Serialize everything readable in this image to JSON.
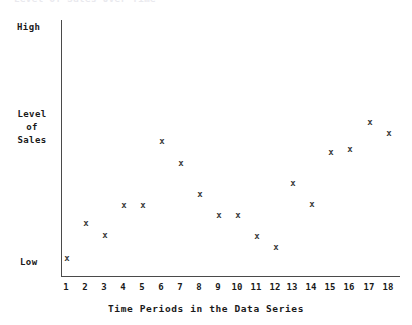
{
  "chart_data": {
    "type": "scatter",
    "title": "Level of Sales Over Time",
    "xlabel": "Time Periods in the Data Series",
    "ylabel": "Level of Sales",
    "ylim": [
      0,
      100
    ],
    "xlim": [
      0.5,
      18.5
    ],
    "grid": false,
    "legend": null,
    "marker": "x",
    "marker_color": "#3a3a3a",
    "y_tick_labels": [
      "Low",
      "High"
    ],
    "y_tick_values": [
      8,
      97
    ],
    "categories": [
      1,
      2,
      3,
      4,
      5,
      6,
      7,
      8,
      9,
      10,
      11,
      12,
      13,
      14,
      15,
      16,
      17,
      18
    ],
    "x_tick_labels": [
      "1",
      "2",
      "3",
      "4",
      "5",
      "6",
      "7",
      "8",
      "9",
      "10",
      "11",
      "12",
      "13",
      "14",
      "15",
      "16",
      "17",
      "18"
    ],
    "values": [
      9,
      23,
      18,
      30,
      30,
      55,
      47,
      35,
      26,
      26,
      17,
      13,
      40,
      30,
      50,
      59,
      70,
      64
    ],
    "points": [
      {
        "x": 1,
        "y": 9,
        "px": 66,
        "py": 258
      },
      {
        "x": 2,
        "y": 23,
        "px": 85,
        "py": 223
      },
      {
        "x": 3,
        "y": 18,
        "px": 104,
        "py": 235
      },
      {
        "x": 4,
        "y": 30,
        "px": 123,
        "py": 205
      },
      {
        "x": 5,
        "y": 30,
        "px": 142,
        "py": 205
      },
      {
        "x": 6,
        "y": 55,
        "px": 161,
        "py": 141
      },
      {
        "x": 7,
        "y": 47,
        "px": 180,
        "py": 163
      },
      {
        "x": 8,
        "y": 35,
        "px": 199,
        "py": 194
      },
      {
        "x": 9,
        "y": 26,
        "px": 218,
        "py": 215
      },
      {
        "x": 10,
        "y": 26,
        "px": 237,
        "py": 215
      },
      {
        "x": 11,
        "y": 17,
        "px": 256,
        "py": 236
      },
      {
        "x": 12,
        "y": 13,
        "px": 275,
        "py": 247
      },
      {
        "x": 13,
        "y": 40,
        "px": 292,
        "py": 183
      },
      {
        "x": 14,
        "y": 30,
        "px": 311,
        "py": 204
      },
      {
        "x": 15,
        "y": 50,
        "px": 330,
        "py": 152
      },
      {
        "x": 16,
        "y": 59,
        "px": 349,
        "py": 149
      },
      {
        "x": 17,
        "y": 70,
        "px": 369,
        "py": 122
      },
      {
        "x": 18,
        "y": 64,
        "px": 388,
        "py": 133
      }
    ]
  },
  "axes": {
    "y_high_label": "High",
    "y_low_label": "Low",
    "y_title_lines": [
      "Level",
      "of",
      "Sales"
    ],
    "x_title": "Time Periods in the Data Series"
  },
  "colors": {
    "axis": "#4a4a4a",
    "marker": "#3a3a3a",
    "text": "#1a1a1a",
    "background": "#ffffff"
  }
}
